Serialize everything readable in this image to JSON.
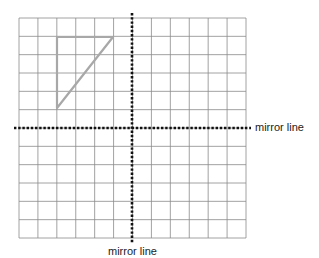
{
  "diagram": {
    "grid": {
      "cols": 12,
      "rows": 12,
      "line_color": "#8a8a8a"
    },
    "shape": {
      "type": "triangle",
      "color": "#a8a8a8",
      "vertices_cells": [
        [
          2,
          1
        ],
        [
          5,
          1
        ],
        [
          2,
          5
        ]
      ]
    },
    "mirror_lines": [
      {
        "orientation": "horizontal",
        "label": "mirror line",
        "style": "dotted"
      },
      {
        "orientation": "vertical",
        "label": "mirror line",
        "style": "dotted"
      }
    ]
  }
}
